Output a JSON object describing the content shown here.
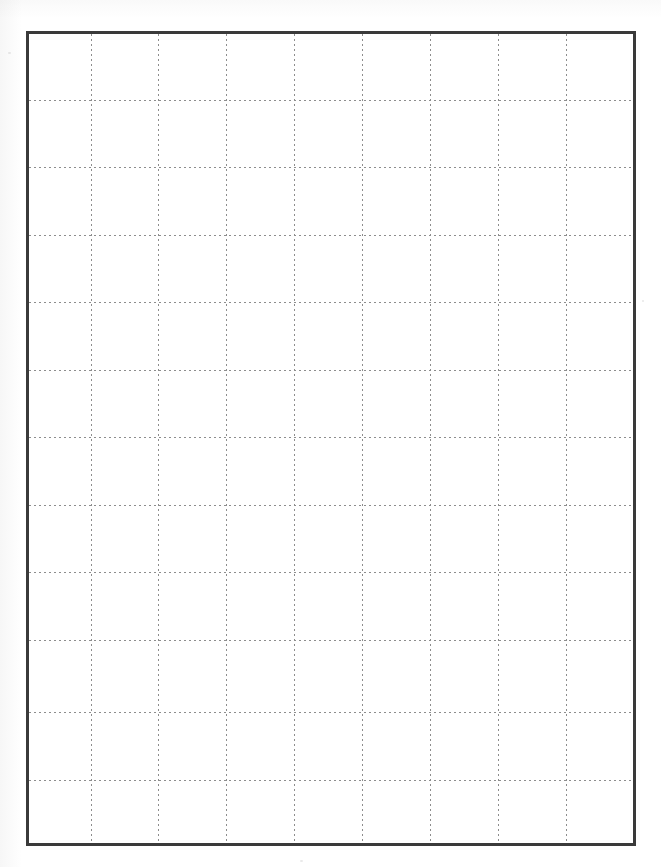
{
  "document": {
    "kind": "grid-paper-sheet",
    "title": "",
    "page_width": 661,
    "page_height": 867,
    "background_color": "#ffffff"
  },
  "frame": {
    "name": "grid-border",
    "left": 26,
    "top": 31,
    "right": 636,
    "bottom": 846,
    "width": 610,
    "height": 815,
    "border_color": "#3a3a3a",
    "border_width": 3,
    "fill_color": "#ffffff"
  },
  "grid": {
    "line_color": "#8d8d8d",
    "line_style": "dotted",
    "line_width": 1,
    "dot_period": 5,
    "columns": 9,
    "rows": 12,
    "cell_width": 67.8,
    "cell_height": 67.6,
    "vertical_lines_x": [
      90.7,
      158.3,
      226.0,
      294.0,
      362.3,
      430.0,
      497.7,
      566.0
    ],
    "horizontal_lines_y": [
      99.7,
      167.3,
      234.7,
      302.3,
      369.7,
      437.0,
      504.7,
      572.3,
      640.0,
      712.0,
      780.0
    ]
  },
  "margin": {
    "tint_color": "#aaaaaa",
    "speck_color": "#969696"
  },
  "labels": {
    "page_region": "page",
    "frame_region": "grid-frame",
    "lines_region": "grid-lines"
  }
}
